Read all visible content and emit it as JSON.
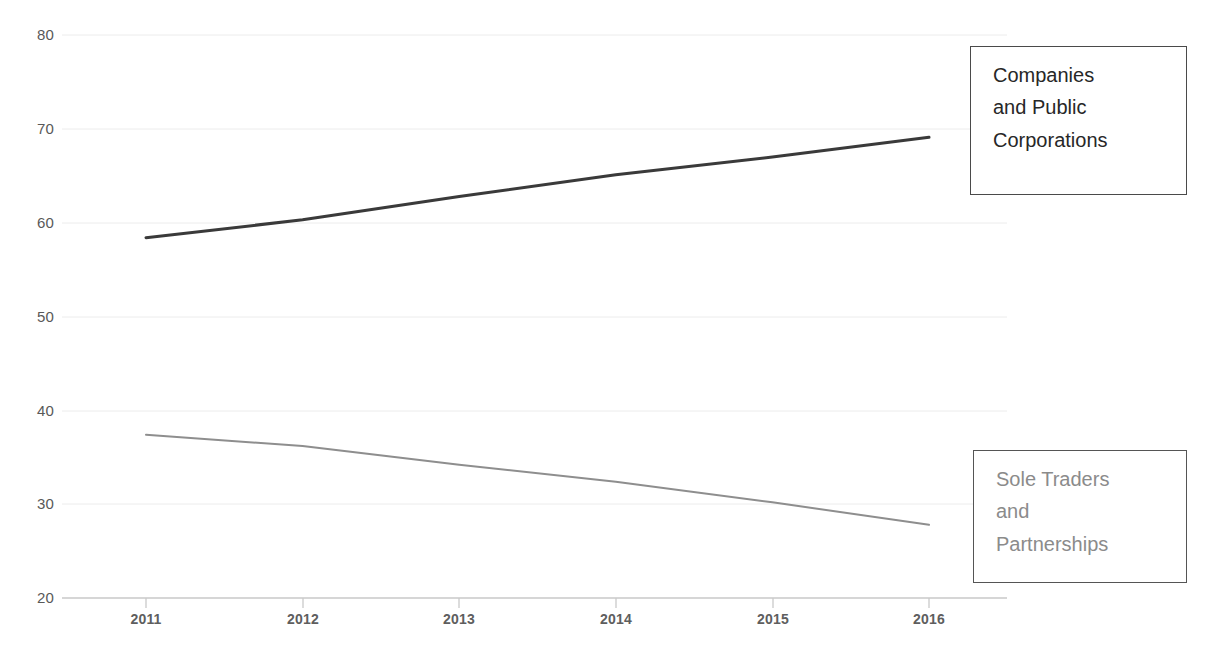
{
  "chart_data": {
    "type": "line",
    "title": "",
    "subtitle": "",
    "xlabel": "",
    "ylabel": "",
    "categories": [
      "2011",
      "2012",
      "2013",
      "2014",
      "2015",
      "2016"
    ],
    "x": [
      2011,
      2012,
      2013,
      2014,
      2015,
      2016
    ],
    "xlim": [
      2010.6,
      2016.5
    ],
    "ylim": [
      20,
      80
    ],
    "yticks": [
      20,
      30,
      40,
      50,
      60,
      70,
      80
    ],
    "ytick_labels": [
      "20",
      "30",
      "40",
      "50",
      "60",
      "70",
      "80"
    ],
    "xtick_labels": [
      "2011",
      "2012",
      "2013",
      "2014",
      "2015",
      "2016"
    ],
    "grid": "horizontal",
    "legend_position": "right-inside-boxes",
    "series": [
      {
        "name": "Companies and Public Corporations",
        "color": "#3a3a3a",
        "width": 3,
        "values": [
          58.4,
          60.3,
          62.8,
          65.1,
          67.0,
          69.1
        ]
      },
      {
        "name": "Sole Traders and Partnerships",
        "color": "#8e8e8e",
        "width": 2,
        "values": [
          37.4,
          36.2,
          34.2,
          32.4,
          30.2,
          27.8
        ]
      }
    ]
  },
  "axes": {
    "y_ticks": [
      {
        "label": "80"
      },
      {
        "label": "70"
      },
      {
        "label": "60"
      },
      {
        "label": "50"
      },
      {
        "label": "40"
      },
      {
        "label": "30"
      },
      {
        "label": "20"
      }
    ],
    "x_ticks": [
      {
        "label": "2011"
      },
      {
        "label": "2012"
      },
      {
        "label": "2013"
      },
      {
        "label": "2014"
      },
      {
        "label": "2015"
      },
      {
        "label": "2016"
      }
    ]
  },
  "legend": {
    "primary": {
      "line1": "Companies",
      "line2": "and Public",
      "line3": "Corporations",
      "full": "Companies and Public Corporations",
      "color": "#272727"
    },
    "secondary": {
      "line1": "Sole Traders",
      "line2": "and",
      "line3": "Partnerships",
      "full": "Sole Traders and Partnerships",
      "color": "#8b8b8b"
    }
  },
  "colors": {
    "series_primary": "#3a3a3a",
    "series_secondary": "#8e8e8e",
    "gridline": "#ededed",
    "axis": "#c9c9c9",
    "tick_text": "#5e5e5e"
  }
}
